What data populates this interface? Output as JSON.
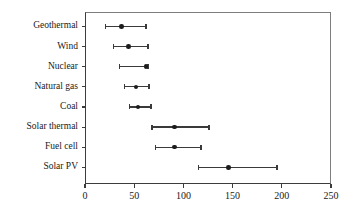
{
  "chart_data": {
    "type": "scatter",
    "orientation": "horizontal",
    "title": "",
    "subtitle": "",
    "xlabel": "",
    "ylabel": "",
    "xlim": [
      0,
      250
    ],
    "ylim": null,
    "grid": false,
    "legend": null,
    "xticks": [
      0,
      50,
      100,
      150,
      200,
      250
    ],
    "xtick_labels": [
      "0",
      "50",
      "100",
      "150",
      "200",
      "250"
    ],
    "categories": [
      "Geothermal",
      "Wind",
      "Nuclear",
      "Natural gas",
      "Coal",
      "Solar thermal",
      "Fuel cell",
      "Solar PV"
    ],
    "series": [
      {
        "name": "estimate",
        "values": [
          37,
          44,
          62,
          52,
          54,
          91,
          91,
          146
        ]
      },
      {
        "name": "range_low",
        "values": [
          21,
          29,
          35,
          40,
          45,
          68,
          72,
          115
        ]
      },
      {
        "name": "range_high",
        "values": [
          62,
          64,
          64,
          65,
          67,
          126,
          118,
          195
        ]
      }
    ],
    "points": [
      {
        "category": "Geothermal",
        "value": 37,
        "low": 21,
        "high": 62
      },
      {
        "category": "Wind",
        "value": 44,
        "low": 29,
        "high": 64
      },
      {
        "category": "Nuclear",
        "value": 62,
        "low": 35,
        "high": 64
      },
      {
        "category": "Natural gas",
        "value": 52,
        "low": 40,
        "high": 65
      },
      {
        "category": "Coal",
        "value": 54,
        "low": 45,
        "high": 67
      },
      {
        "category": "Solar thermal",
        "value": 91,
        "low": 68,
        "high": 126
      },
      {
        "category": "Fuel cell",
        "value": 91,
        "low": 72,
        "high": 118
      },
      {
        "category": "Solar PV",
        "value": 146,
        "low": 115,
        "high": 195
      }
    ],
    "colors": {
      "marker": "#1c1c1c",
      "line": "#3a3a3a",
      "axis": "#3c3c3c",
      "text": "#1a1a1a",
      "background": "#ffffff"
    }
  }
}
